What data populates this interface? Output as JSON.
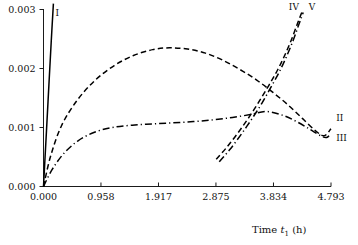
{
  "chart_data": {
    "type": "line",
    "title": "",
    "subtitle": "",
    "xlabel": "Time t1 (h)",
    "xlabel_parts": {
      "text": "Time ",
      "italic": "t",
      "sub": "1",
      "unit": " (h)"
    },
    "ylabel": "",
    "xlim": [
      0.0,
      4.793
    ],
    "ylim": [
      0.0,
      0.003
    ],
    "grid": false,
    "legend_position": "inline-curve-labels",
    "xticks": [
      0.0,
      0.958,
      1.917,
      2.875,
      3.834,
      4.793
    ],
    "xtick_labels": [
      "0.000",
      "0.958",
      "1.917",
      "2.875",
      "3.834",
      "4.793"
    ],
    "yticks": [
      0.0,
      0.001,
      0.002,
      0.003
    ],
    "ytick_labels": [
      "0.000",
      "0.001",
      "0.002",
      "0.003"
    ],
    "series": [
      {
        "name": "I",
        "label": "I",
        "linestyle": "solid",
        "color": "#000000",
        "x": [
          0.0,
          0.02,
          0.05,
          0.09,
          0.13,
          0.165
        ],
        "values": [
          0.0,
          0.00038,
          0.00095,
          0.00172,
          0.00248,
          0.0031
        ]
      },
      {
        "name": "II",
        "label": "II",
        "linestyle": "dashed",
        "color": "#000000",
        "x": [
          0.0,
          0.12,
          0.3,
          0.56,
          0.86,
          1.18,
          1.5,
          1.82,
          2.1,
          2.4,
          2.7,
          2.99,
          3.28,
          3.56,
          3.83,
          4.08,
          4.32,
          4.54,
          4.68,
          4.793
        ],
        "values": [
          0.0,
          0.00052,
          0.00103,
          0.00146,
          0.0018,
          0.00205,
          0.00222,
          0.00232,
          0.00235,
          0.00233,
          0.00226,
          0.00214,
          0.00198,
          0.0018,
          0.00159,
          0.00138,
          0.00115,
          0.00094,
          0.00086,
          0.00098
        ]
      },
      {
        "name": "III",
        "label": "III",
        "linestyle": "dashdot",
        "color": "#000000",
        "x": [
          0.0,
          0.14,
          0.33,
          0.57,
          0.85,
          1.15,
          1.48,
          1.82,
          2.16,
          2.5,
          2.83,
          3.15,
          3.45,
          3.72,
          3.98,
          4.22,
          4.44,
          4.62,
          4.72,
          4.793
        ],
        "values": [
          0.0,
          0.00028,
          0.00055,
          0.00077,
          0.00092,
          0.001,
          0.00104,
          0.00106,
          0.00108,
          0.0011,
          0.00113,
          0.00117,
          0.00122,
          0.00127,
          0.00121,
          0.0011,
          0.00097,
          0.00086,
          0.00083,
          0.0009
        ]
      },
      {
        "name": "IV",
        "label": "IV",
        "linestyle": "dashed",
        "color": "#000000",
        "x": [
          2.88,
          3.06,
          3.25,
          3.43,
          3.6,
          3.76,
          3.9,
          4.02,
          4.13,
          4.23,
          4.31
        ],
        "values": [
          0.00046,
          0.00067,
          0.00092,
          0.00118,
          0.00145,
          0.00172,
          0.00197,
          0.00222,
          0.00248,
          0.00275,
          0.00296
        ]
      },
      {
        "name": "V",
        "label": "V",
        "linestyle": "dashdot",
        "color": "#000000",
        "x": [
          2.93,
          3.11,
          3.3,
          3.47,
          3.64,
          3.79,
          3.93,
          4.05,
          4.16,
          4.255,
          4.33
        ],
        "values": [
          0.00042,
          0.00063,
          0.00089,
          0.00114,
          0.00141,
          0.00168,
          0.00194,
          0.0022,
          0.00247,
          0.00274,
          0.00295
        ]
      }
    ],
    "annotations": [
      {
        "text": "I",
        "x": 0.2,
        "y": 0.00295,
        "series": "I"
      },
      {
        "text": "IV",
        "x": 4.09,
        "y": 0.00305,
        "series": "IV"
      },
      {
        "text": "V",
        "x": 4.42,
        "y": 0.00305,
        "series": "V"
      },
      {
        "text": "II",
        "x": 4.88,
        "y": 0.00117,
        "series": "II"
      },
      {
        "text": "III",
        "x": 4.88,
        "y": 0.00083,
        "series": "III"
      }
    ]
  }
}
